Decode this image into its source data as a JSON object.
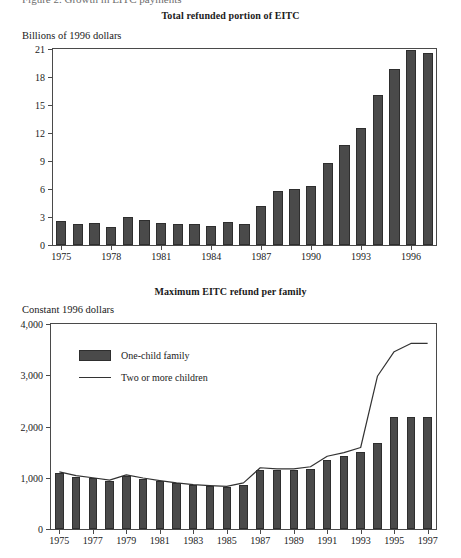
{
  "page": {
    "clipped_header_text": "Figure 2.  Growth in EITC payments"
  },
  "chart_data": [
    {
      "id": "total-refunded-portion",
      "type": "bar",
      "title": "Total refunded portion of EITC",
      "ylabel": "Billions of 1996 dollars",
      "xlabel": "",
      "ylim": [
        0,
        21
      ],
      "yticks": [
        0,
        3,
        6,
        9,
        12,
        15,
        18,
        21
      ],
      "ytick_labels": [
        "0",
        "3",
        "6",
        "9",
        "12",
        "15",
        "18",
        "21"
      ],
      "grid": false,
      "legend": "none",
      "categories": [
        1975,
        1976,
        1977,
        1978,
        1979,
        1980,
        1981,
        1982,
        1983,
        1984,
        1985,
        1986,
        1987,
        1988,
        1989,
        1990,
        1991,
        1992,
        1993,
        1994,
        1995,
        1996,
        1997
      ],
      "xtick_labels": [
        "1975",
        "1978",
        "1981",
        "1984",
        "1987",
        "1990",
        "1993",
        "1996"
      ],
      "xtick_years": [
        1975,
        1978,
        1981,
        1984,
        1987,
        1990,
        1993,
        1996
      ],
      "values": [
        2.6,
        2.3,
        2.4,
        1.95,
        3.05,
        2.65,
        2.4,
        2.25,
        2.25,
        2.05,
        2.45,
        2.3,
        4.15,
        5.75,
        6.0,
        6.3,
        8.8,
        10.7,
        12.5,
        16.1,
        18.9,
        20.9,
        20.6
      ],
      "series_name": "Total refunded portion of EITC"
    },
    {
      "id": "maximum-eitc-refund",
      "type": "bar+line",
      "title": "Maximum EITC refund per family",
      "ylabel": "Constant 1996 dollars",
      "xlabel": "",
      "ylim": [
        0,
        4000
      ],
      "yticks": [
        0,
        1000,
        2000,
        3000,
        4000
      ],
      "ytick_labels": [
        "0",
        "1,000",
        "2,000",
        "3,000",
        "4,000"
      ],
      "grid": false,
      "legend": "inside-top-left",
      "categories": [
        1975,
        1976,
        1977,
        1978,
        1979,
        1980,
        1981,
        1982,
        1983,
        1984,
        1985,
        1986,
        1987,
        1988,
        1989,
        1990,
        1991,
        1992,
        1993,
        1994,
        1995,
        1996,
        1997
      ],
      "xtick_labels": [
        "1975",
        "1977",
        "1979",
        "1981",
        "1983",
        "1985",
        "1987",
        "1989",
        "1991",
        "1993",
        "1995",
        "1997"
      ],
      "xtick_years": [
        1975,
        1977,
        1979,
        1981,
        1983,
        1985,
        1987,
        1989,
        1991,
        1993,
        1995,
        1997
      ],
      "series": [
        {
          "name": "One-child family",
          "kind": "bar",
          "values": [
            1090,
            1020,
            990,
            945,
            1040,
            980,
            930,
            890,
            855,
            835,
            820,
            850,
            1160,
            1150,
            1150,
            1180,
            1350,
            1420,
            1500,
            1670,
            2180,
            2180,
            2180
          ]
        },
        {
          "name": "Two or more children",
          "kind": "line",
          "values": [
            1115,
            1040,
            1000,
            955,
            1055,
            995,
            945,
            900,
            865,
            845,
            830,
            900,
            1195,
            1175,
            1175,
            1215,
            1420,
            1490,
            1590,
            2980,
            3460,
            3620,
            3620
          ]
        }
      ]
    }
  ]
}
